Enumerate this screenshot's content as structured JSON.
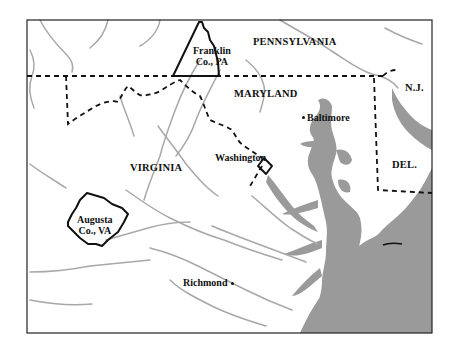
{
  "map": {
    "colors": {
      "background": "#ffffff",
      "frame": "#222222",
      "water": "#9a9a9a",
      "rivers": "#a8a8a8",
      "state_border": "#111111",
      "county_outline": "#111111"
    },
    "states": [
      {
        "id": "pennsylvania",
        "label": "PENNSYLVANIA"
      },
      {
        "id": "maryland",
        "label": "MARYLAND"
      },
      {
        "id": "virginia",
        "label": "VIRGINIA"
      },
      {
        "id": "new-jersey",
        "label": "N.J."
      },
      {
        "id": "delaware",
        "label": "DEL."
      }
    ],
    "counties": [
      {
        "id": "franklin",
        "line1": "Franklin",
        "line2": "Co., PA"
      },
      {
        "id": "augusta",
        "line1": "Augusta",
        "line2": "Co., VA"
      }
    ],
    "cities": [
      {
        "id": "baltimore",
        "label": "Baltimore"
      },
      {
        "id": "washington",
        "label": "Washington"
      },
      {
        "id": "richmond",
        "label": "Richmond"
      }
    ]
  }
}
